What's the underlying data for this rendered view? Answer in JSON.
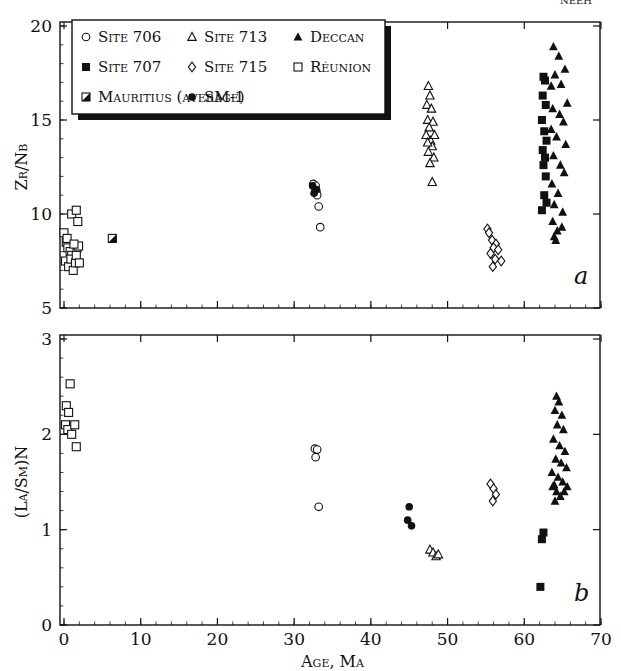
{
  "corner_text": "NEEH",
  "chart_data": [
    {
      "panel": "a",
      "type": "scatter",
      "xlabel": "",
      "ylabel": "Zr/Nb",
      "xlim": [
        0,
        70
      ],
      "ylim": [
        5,
        20
      ],
      "yticks": [
        5,
        10,
        15,
        20
      ],
      "xticks": [
        0,
        10,
        20,
        30,
        40,
        50,
        60,
        70
      ],
      "grid": false,
      "legend_position": "upper-left inset",
      "legend": [
        {
          "name": "Site 706",
          "marker": "circle-open"
        },
        {
          "name": "Site 713",
          "marker": "triangle-open"
        },
        {
          "name": "Deccan",
          "marker": "triangle-filled"
        },
        {
          "name": "Site 707",
          "marker": "square-filled"
        },
        {
          "name": "Site 715",
          "marker": "diamond-open"
        },
        {
          "name": "Réunion",
          "marker": "square-open"
        },
        {
          "name": "Mauritius (average)",
          "marker": "square-half"
        },
        {
          "name": "SM-1",
          "marker": "circle-filled"
        }
      ],
      "series": [
        {
          "name": "Réunion",
          "marker": "square-open",
          "points": [
            [
              0,
              9.0
            ],
            [
              0.3,
              8.5
            ],
            [
              0.5,
              8.2
            ],
            [
              0.8,
              8.0
            ],
            [
              1.0,
              7.8
            ],
            [
              0.2,
              7.5
            ],
            [
              0.6,
              7.2
            ],
            [
              1.2,
              7.0
            ],
            [
              0.9,
              7.6
            ],
            [
              1.5,
              7.4
            ],
            [
              1.7,
              8.2
            ],
            [
              1.9,
              8.3
            ],
            [
              1.6,
              7.8
            ],
            [
              2.0,
              7.4
            ],
            [
              1.0,
              10.0
            ],
            [
              1.6,
              10.2
            ],
            [
              1.8,
              9.6
            ],
            [
              0.4,
              8.7
            ],
            [
              1.3,
              8.4
            ]
          ]
        },
        {
          "name": "Mauritius (average)",
          "marker": "square-half",
          "points": [
            [
              6.3,
              8.7
            ]
          ]
        },
        {
          "name": "Site 706",
          "marker": "circle-open",
          "points": [
            [
              32.5,
              11.6
            ],
            [
              32.7,
              11.4
            ],
            [
              32.9,
              11.2
            ],
            [
              33.0,
              11.0
            ],
            [
              33.2,
              10.4
            ],
            [
              33.4,
              9.3
            ],
            [
              32.8,
              11.5
            ]
          ]
        },
        {
          "name": "SM-1",
          "marker": "circle-filled",
          "points": [
            [
              32.4,
              11.5
            ],
            [
              32.6,
              11.1
            ],
            [
              32.9,
              11.3
            ]
          ]
        },
        {
          "name": "Site 713",
          "marker": "triangle-open",
          "points": [
            [
              47.5,
              16.8
            ],
            [
              47.7,
              16.3
            ],
            [
              47.3,
              15.8
            ],
            [
              47.9,
              15.6
            ],
            [
              47.4,
              15.0
            ],
            [
              48.1,
              14.9
            ],
            [
              47.6,
              14.6
            ],
            [
              47.2,
              14.2
            ],
            [
              47.8,
              13.9
            ],
            [
              48.0,
              13.6
            ],
            [
              47.5,
              13.3
            ],
            [
              48.2,
              13.0
            ],
            [
              47.7,
              12.7
            ],
            [
              48.0,
              11.7
            ],
            [
              47.4,
              13.8
            ],
            [
              48.3,
              14.2
            ]
          ]
        },
        {
          "name": "Site 715",
          "marker": "diamond-open",
          "points": [
            [
              55.2,
              9.2
            ],
            [
              55.4,
              9.0
            ],
            [
              55.8,
              8.6
            ],
            [
              56.3,
              8.4
            ],
            [
              56.0,
              8.2
            ],
            [
              55.6,
              7.9
            ],
            [
              56.6,
              8.1
            ],
            [
              56.2,
              7.6
            ],
            [
              55.9,
              7.2
            ],
            [
              57.0,
              7.5
            ]
          ]
        },
        {
          "name": "Site 707",
          "marker": "square-filled",
          "points": [
            [
              62.5,
              17.3
            ],
            [
              62.7,
              17.1
            ],
            [
              62.4,
              16.3
            ],
            [
              62.8,
              15.8
            ],
            [
              62.3,
              15.0
            ],
            [
              62.6,
              14.4
            ],
            [
              62.9,
              13.9
            ],
            [
              62.4,
              13.4
            ],
            [
              62.7,
              13.0
            ],
            [
              62.5,
              12.6
            ],
            [
              62.8,
              12.0
            ],
            [
              62.6,
              11.0
            ],
            [
              62.3,
              10.2
            ],
            [
              62.9,
              10.6
            ]
          ]
        },
        {
          "name": "Deccan",
          "marker": "triangle-filled",
          "points": [
            [
              63.8,
              18.9
            ],
            [
              64.5,
              18.4
            ],
            [
              65.3,
              17.7
            ],
            [
              64.0,
              17.4
            ],
            [
              63.5,
              16.8
            ],
            [
              64.8,
              16.9
            ],
            [
              65.6,
              15.9
            ],
            [
              63.7,
              15.6
            ],
            [
              64.6,
              15.3
            ],
            [
              65.1,
              14.9
            ],
            [
              63.5,
              14.5
            ],
            [
              64.2,
              14.1
            ],
            [
              65.4,
              13.7
            ],
            [
              63.8,
              13.1
            ],
            [
              64.7,
              12.6
            ],
            [
              65.2,
              12.2
            ],
            [
              63.6,
              11.6
            ],
            [
              64.4,
              11.1
            ],
            [
              63.9,
              10.5
            ],
            [
              65.0,
              10.1
            ],
            [
              63.7,
              9.6
            ],
            [
              64.3,
              9.1
            ],
            [
              63.9,
              8.8
            ],
            [
              64.1,
              8.6
            ],
            [
              64.9,
              9.3
            ]
          ]
        }
      ],
      "annotations": [
        "a"
      ]
    },
    {
      "panel": "b",
      "type": "scatter",
      "xlabel": "Age, Ma",
      "ylabel": "(La/Sm)N",
      "xlim": [
        0,
        70
      ],
      "ylim": [
        0,
        3
      ],
      "yticks": [
        0,
        1,
        2,
        3
      ],
      "xticks": [
        0,
        10,
        20,
        30,
        40,
        50,
        60,
        70
      ],
      "grid": false,
      "series": [
        {
          "name": "Réunion",
          "marker": "square-open",
          "points": [
            [
              0.3,
              2.3
            ],
            [
              0.8,
              2.53
            ],
            [
              0.6,
              2.23
            ],
            [
              0.2,
              2.1
            ],
            [
              0.5,
              2.05
            ],
            [
              1.0,
              2.0
            ],
            [
              1.4,
              2.1
            ],
            [
              1.6,
              1.87
            ]
          ]
        },
        {
          "name": "Site 706",
          "marker": "circle-open",
          "points": [
            [
              32.7,
              1.85
            ],
            [
              33.0,
              1.84
            ],
            [
              32.8,
              1.76
            ],
            [
              33.2,
              1.24
            ]
          ]
        },
        {
          "name": "SM-1",
          "marker": "circle-filled",
          "points": [
            [
              45.0,
              1.24
            ],
            [
              44.8,
              1.1
            ],
            [
              45.3,
              1.04
            ]
          ]
        },
        {
          "name": "Site 713",
          "marker": "triangle-open",
          "points": [
            [
              47.7,
              0.79
            ],
            [
              48.1,
              0.76
            ],
            [
              48.5,
              0.72
            ],
            [
              48.8,
              0.74
            ]
          ]
        },
        {
          "name": "Site 715",
          "marker": "diamond-open",
          "points": [
            [
              55.6,
              1.48
            ],
            [
              56.0,
              1.43
            ],
            [
              56.3,
              1.37
            ],
            [
              55.9,
              1.3
            ]
          ]
        },
        {
          "name": "Site 707",
          "marker": "square-filled",
          "points": [
            [
              62.5,
              0.97
            ],
            [
              62.3,
              0.9
            ],
            [
              62.1,
              0.4
            ]
          ]
        },
        {
          "name": "Deccan",
          "marker": "triangle-filled",
          "points": [
            [
              64.2,
              2.4
            ],
            [
              64.5,
              2.34
            ],
            [
              64.0,
              2.25
            ],
            [
              64.9,
              2.2
            ],
            [
              64.3,
              2.1
            ],
            [
              65.1,
              2.05
            ],
            [
              63.8,
              1.95
            ],
            [
              64.6,
              1.88
            ],
            [
              65.3,
              1.82
            ],
            [
              64.1,
              1.74
            ],
            [
              64.8,
              1.7
            ],
            [
              65.5,
              1.65
            ],
            [
              63.6,
              1.6
            ],
            [
              64.4,
              1.55
            ],
            [
              65.0,
              1.5
            ],
            [
              63.9,
              1.47
            ],
            [
              65.6,
              1.45
            ],
            [
              64.2,
              1.4
            ],
            [
              64.7,
              1.35
            ],
            [
              64.0,
              1.3
            ],
            [
              65.2,
              1.4
            ],
            [
              63.7,
              1.45
            ]
          ]
        }
      ],
      "annotations": [
        "b"
      ]
    }
  ]
}
